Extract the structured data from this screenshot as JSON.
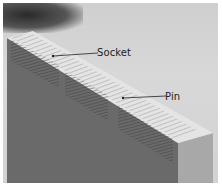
{
  "image": {
    "description": "Grayscale photo of a wooden board end showing a dovetail joint with hatched end grain",
    "labels": [
      {
        "text": "Socket",
        "x": 97,
        "y": 45
      },
      {
        "text": "Pin",
        "x": 165,
        "y": 88
      }
    ],
    "colors": {
      "background": "#d4d4d4",
      "wood_face": "#6e6e6e",
      "top_edge": "#e6e6e6",
      "text": "#222222"
    }
  }
}
